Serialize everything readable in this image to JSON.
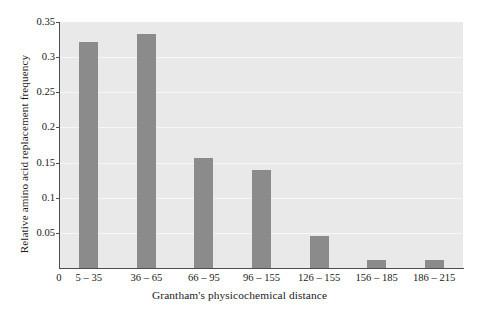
{
  "chart_data": {
    "type": "bar",
    "title": "",
    "xlabel": "Grantham's physicochemical distance",
    "ylabel": "Relative amino acid replacement frequency",
    "categories": [
      "5 – 35",
      "36 – 65",
      "66 – 95",
      "96 – 155",
      "126 – 155",
      "156 – 185",
      "186 – 215"
    ],
    "values": [
      0.322,
      0.333,
      0.156,
      0.139,
      0.045,
      0.012,
      0.012
    ],
    "ylim": [
      0,
      0.35
    ],
    "yticks": [
      0.05,
      0.1,
      0.15,
      0.2,
      0.25,
      0.3,
      0.35
    ],
    "ytick_labels": [
      "0.05",
      "0.1",
      "0.15",
      "0.2",
      "0.25",
      "0.3",
      "0.35"
    ],
    "x_origin_label": "0",
    "grid": true,
    "grid_axis": "y",
    "legend": false,
    "bar_color": "#8b8b8b",
    "plot_background": "#e9e9e9",
    "axis_color": "#4d4d4d",
    "gridline_color": "#f7f7f7"
  }
}
